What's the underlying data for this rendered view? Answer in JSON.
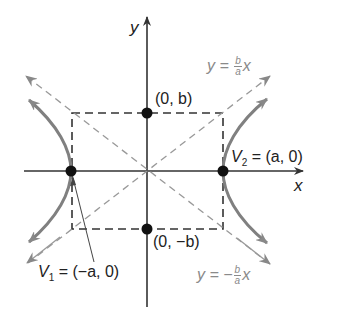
{
  "figure": {
    "axes": {
      "x_label": "x",
      "y_label": "y"
    },
    "points": {
      "top": "(0, b)",
      "bottom": "(0, −b)",
      "v1_name": "V",
      "v1_sub": "1",
      "v1_eq": " = (−a, 0)",
      "v2_name": "V",
      "v2_sub": "2",
      "v2_eq": " = (a, 0)"
    },
    "asymptotes": {
      "upper": {
        "lhs": "y = ",
        "num": "b",
        "den": "a",
        "rhs": "x"
      },
      "lower": {
        "lhs": "y = −",
        "num": "b",
        "den": "a",
        "rhs": "x"
      }
    },
    "colors": {
      "axis": "#333333",
      "curve": "#808080",
      "asymptote": "#9a9a9a",
      "box": "#333333",
      "point": "#111111"
    }
  }
}
